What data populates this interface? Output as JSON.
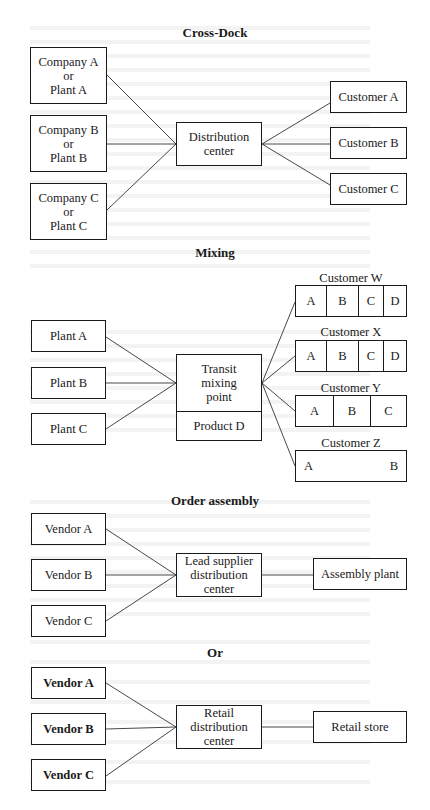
{
  "cross_dock": {
    "title": "Cross-Dock",
    "sources": [
      {
        "line1": "Company A",
        "line2": "or",
        "line3": "Plant A"
      },
      {
        "line1": "Company B",
        "line2": "or",
        "line3": "Plant B"
      },
      {
        "line1": "Company C",
        "line2": "or",
        "line3": "Plant C"
      }
    ],
    "hub": {
      "line1": "Distribution",
      "line2": "center"
    },
    "customers": [
      "Customer A",
      "Customer B",
      "Customer C"
    ]
  },
  "mixing": {
    "title": "Mixing",
    "plants": [
      "Plant A",
      "Plant B",
      "Plant C"
    ],
    "hub": {
      "line1": "Transit",
      "line2": "mixing",
      "line3": "point",
      "bottom": "Product D"
    },
    "customers": [
      {
        "name": "Customer W",
        "cells": [
          "A",
          "B",
          "C",
          "D"
        ]
      },
      {
        "name": "Customer X",
        "cells": [
          "A",
          "B",
          "C",
          "D"
        ]
      },
      {
        "name": "Customer Y",
        "cells": [
          "A",
          "B",
          "C"
        ]
      },
      {
        "name": "Customer Z",
        "cells": [
          "A",
          "B"
        ]
      }
    ]
  },
  "order_assembly": {
    "title": "Order assembly",
    "vendors": [
      "Vendor A",
      "Vendor B",
      "Vendor C"
    ],
    "hub": {
      "line1": "Lead supplier",
      "line2": "distribution",
      "line3": "center"
    },
    "destination": "Assembly plant"
  },
  "or_label": "Or",
  "retail": {
    "vendors": [
      "Vendor A",
      "Vendor B",
      "Vendor C"
    ],
    "hub": {
      "line1": "Retail",
      "line2": "distribution",
      "line3": "center"
    },
    "destination": "Retail store"
  }
}
